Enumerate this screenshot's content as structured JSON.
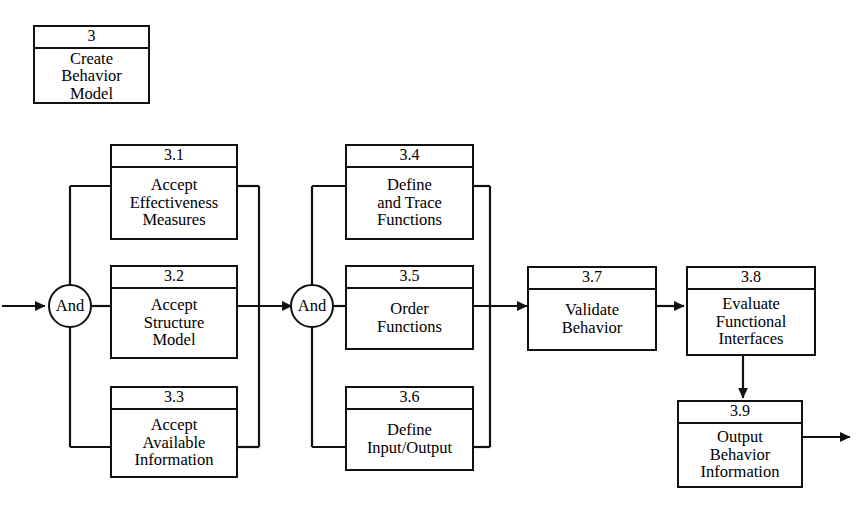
{
  "diagram": {
    "title": "Create Behavior Model",
    "type": "functional-flow-block-diagram",
    "line_color": "#111111",
    "background_color": "#ffffff",
    "parent": {
      "id": "3",
      "title_lines": [
        "Create",
        "Behavior",
        "Model"
      ]
    },
    "junctions": [
      {
        "label": "And",
        "name": "and-junction-1"
      },
      {
        "label": "And",
        "name": "and-junction-2"
      }
    ],
    "nodes": [
      {
        "id": "3.1",
        "title_lines": [
          "Accept",
          "Effectiveness",
          "Measures"
        ]
      },
      {
        "id": "3.2",
        "title_lines": [
          "Accept",
          "Structure",
          "Model"
        ]
      },
      {
        "id": "3.3",
        "title_lines": [
          "Accept",
          "Available",
          "Information"
        ]
      },
      {
        "id": "3.4",
        "title_lines": [
          "Define",
          "and Trace",
          "Functions"
        ]
      },
      {
        "id": "3.5",
        "title_lines": [
          "Order",
          "Functions"
        ]
      },
      {
        "id": "3.6",
        "title_lines": [
          "Define",
          "Input/Output"
        ]
      },
      {
        "id": "3.7",
        "title_lines": [
          "Validate",
          "Behavior"
        ]
      },
      {
        "id": "3.8",
        "title_lines": [
          "Evaluate",
          "Functional",
          "Interfaces"
        ]
      },
      {
        "id": "3.9",
        "title_lines": [
          "Output",
          "Behavior",
          "Information"
        ]
      }
    ]
  }
}
